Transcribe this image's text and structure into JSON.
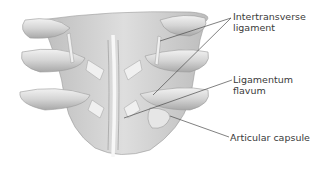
{
  "diagram": {
    "labels": [
      {
        "id": "intertransverse",
        "lines": [
          "Intertransverse",
          "ligament"
        ]
      },
      {
        "id": "flavum",
        "lines": [
          "Ligamentum",
          "flavum"
        ]
      },
      {
        "id": "capsule",
        "lines": [
          "Articular capsule"
        ]
      }
    ],
    "colors": {
      "bone_light": "#efefef",
      "bone_mid": "#cfcfcf",
      "bone_dark": "#9a9a9a",
      "line": "#4a4a4a",
      "text": "#3a3a3a"
    }
  }
}
